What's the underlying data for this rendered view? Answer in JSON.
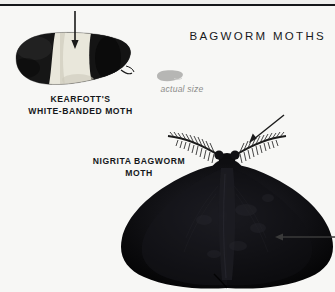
{
  "page": {
    "background_color": "#f7f7f5",
    "rule_color": "#15171a"
  },
  "header": {
    "section_title": "BAGWORM MOTHS"
  },
  "scale_reference": {
    "label": "actual size",
    "color": "#8d8d8b",
    "icon": "moth-silhouette-icon"
  },
  "specimens": [
    {
      "id": "kearfotts-white-banded-moth",
      "caption_line_1": "KEARFOTT'S",
      "caption_line_2": "WHITE-BANDED MOTH",
      "color": "#141414",
      "band_color": "#e8e6da",
      "pointers": [
        {
          "name": "pointer-arrow-white-band",
          "direction": "down"
        }
      ]
    },
    {
      "id": "nigrita-bagworm-moth",
      "caption_line_1": "NIGRITA BAGWORM",
      "caption_line_2": "MOTH",
      "color": "#0d0d0d",
      "pointers": [
        {
          "name": "pointer-arrow-antenna",
          "direction": "down-left"
        },
        {
          "name": "pointer-arrow-wing",
          "direction": "left"
        }
      ]
    }
  ]
}
